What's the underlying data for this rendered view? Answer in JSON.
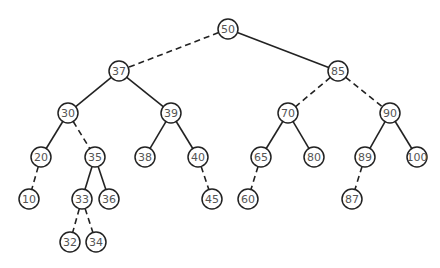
{
  "diagram": {
    "type": "binary-search-tree",
    "radius": 10,
    "colors": {
      "stroke": "#222222",
      "text": "#555555",
      "background": "#ffffff"
    },
    "nodes": [
      {
        "id": "n50",
        "label": "50",
        "x": 228,
        "y": 29
      },
      {
        "id": "n37",
        "label": "37",
        "x": 119,
        "y": 71
      },
      {
        "id": "n85",
        "label": "85",
        "x": 338,
        "y": 71
      },
      {
        "id": "n30",
        "label": "30",
        "x": 68,
        "y": 113
      },
      {
        "id": "n39",
        "label": "39",
        "x": 171,
        "y": 113
      },
      {
        "id": "n70",
        "label": "70",
        "x": 288,
        "y": 113
      },
      {
        "id": "n90",
        "label": "90",
        "x": 390,
        "y": 113
      },
      {
        "id": "n20",
        "label": "20",
        "x": 41,
        "y": 157
      },
      {
        "id": "n35",
        "label": "35",
        "x": 95,
        "y": 157
      },
      {
        "id": "n38",
        "label": "38",
        "x": 145,
        "y": 157
      },
      {
        "id": "n40",
        "label": "40",
        "x": 198,
        "y": 157
      },
      {
        "id": "n65",
        "label": "65",
        "x": 261,
        "y": 157
      },
      {
        "id": "n80",
        "label": "80",
        "x": 314,
        "y": 157
      },
      {
        "id": "n89",
        "label": "89",
        "x": 365,
        "y": 157
      },
      {
        "id": "n100",
        "label": "100",
        "x": 417,
        "y": 157
      },
      {
        "id": "n10",
        "label": "10",
        "x": 29,
        "y": 199
      },
      {
        "id": "n33",
        "label": "33",
        "x": 82,
        "y": 199
      },
      {
        "id": "n36",
        "label": "36",
        "x": 109,
        "y": 199
      },
      {
        "id": "n45",
        "label": "45",
        "x": 212,
        "y": 199
      },
      {
        "id": "n60",
        "label": "60",
        "x": 248,
        "y": 199
      },
      {
        "id": "n87",
        "label": "87",
        "x": 352,
        "y": 199
      },
      {
        "id": "n32",
        "label": "32",
        "x": 70,
        "y": 242
      },
      {
        "id": "n34",
        "label": "34",
        "x": 96,
        "y": 242
      }
    ],
    "edges": [
      {
        "from": "n50",
        "to": "n37",
        "style": "dashed"
      },
      {
        "from": "n50",
        "to": "n85",
        "style": "solid"
      },
      {
        "from": "n37",
        "to": "n30",
        "style": "solid"
      },
      {
        "from": "n37",
        "to": "n39",
        "style": "solid"
      },
      {
        "from": "n85",
        "to": "n70",
        "style": "dashed"
      },
      {
        "from": "n85",
        "to": "n90",
        "style": "dashed"
      },
      {
        "from": "n30",
        "to": "n20",
        "style": "solid"
      },
      {
        "from": "n30",
        "to": "n35",
        "style": "dashed"
      },
      {
        "from": "n39",
        "to": "n38",
        "style": "solid"
      },
      {
        "from": "n39",
        "to": "n40",
        "style": "solid"
      },
      {
        "from": "n70",
        "to": "n65",
        "style": "solid"
      },
      {
        "from": "n70",
        "to": "n80",
        "style": "solid"
      },
      {
        "from": "n90",
        "to": "n89",
        "style": "solid"
      },
      {
        "from": "n90",
        "to": "n100",
        "style": "solid"
      },
      {
        "from": "n20",
        "to": "n10",
        "style": "dashed"
      },
      {
        "from": "n35",
        "to": "n33",
        "style": "solid"
      },
      {
        "from": "n35",
        "to": "n36",
        "style": "solid"
      },
      {
        "from": "n40",
        "to": "n45",
        "style": "dashed"
      },
      {
        "from": "n65",
        "to": "n60",
        "style": "dashed"
      },
      {
        "from": "n89",
        "to": "n87",
        "style": "dashed"
      },
      {
        "from": "n33",
        "to": "n32",
        "style": "dashed"
      },
      {
        "from": "n33",
        "to": "n34",
        "style": "dashed"
      }
    ]
  }
}
